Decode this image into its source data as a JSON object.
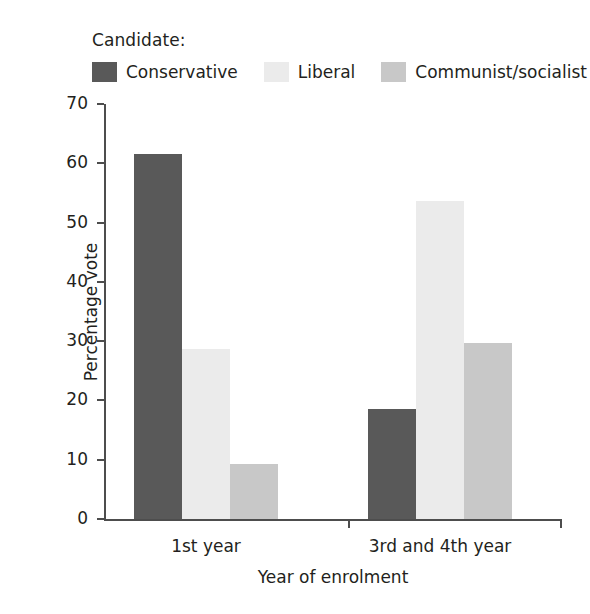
{
  "legend": {
    "title": "Candidate:",
    "items": [
      {
        "label": "Conservative",
        "color": "#595959"
      },
      {
        "label": "Liberal",
        "color": "#ebebeb"
      },
      {
        "label": "Communist/socialist",
        "color": "#c8c8c8"
      }
    ]
  },
  "axes": {
    "ylabel": "Percentage vote",
    "xlabel": "Year of enrolment",
    "yticks": [
      "0",
      "10",
      "20",
      "30",
      "40",
      "50",
      "60",
      "70"
    ],
    "xcategories": [
      "1st year",
      "3rd and 4th year"
    ]
  },
  "chart_data": {
    "type": "bar",
    "title": "",
    "xlabel": "Year of enrolment",
    "ylabel": "Percentage vote",
    "ylim": [
      0,
      70
    ],
    "ytick_step": 10,
    "grid": false,
    "legend_title": "Candidate:",
    "legend_position": "top",
    "categories": [
      "1st year",
      "3rd and 4th year"
    ],
    "series": [
      {
        "name": "Conservative",
        "color": "#595959",
        "values": [
          61.5,
          18.5
        ]
      },
      {
        "name": "Liberal",
        "color": "#ebebeb",
        "values": [
          28.7,
          53.7
        ]
      },
      {
        "name": "Communist/socialist",
        "color": "#c8c8c8",
        "values": [
          9.3,
          29.7
        ]
      }
    ]
  }
}
